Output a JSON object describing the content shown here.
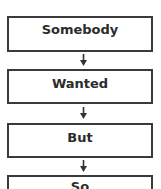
{
  "flowchart": {
    "steps": [
      {
        "label": "Somebody"
      },
      {
        "label": "Wanted"
      },
      {
        "label": "But"
      },
      {
        "label": "So"
      }
    ],
    "colors": {
      "border": "#3a3a3a",
      "text": "#2b2b2b",
      "background": "#ffffff"
    }
  }
}
